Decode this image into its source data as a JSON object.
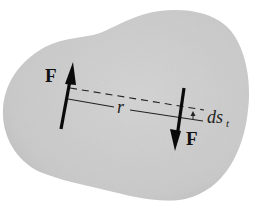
{
  "figure": {
    "colors": {
      "background": "#ffffff",
      "body_fill": "#cdcdcd",
      "body_edge": "#bdbdbd",
      "ink": "#111111"
    },
    "labels": {
      "force_left": "F",
      "force_right": "F",
      "distance": "r",
      "displacement_main": "ds",
      "displacement_sub": "t"
    },
    "elements": {
      "body": "irregular rigid body (gray blob)",
      "force_left_direction": "up",
      "force_right_direction": "down",
      "dashed_line": "displaced line of action between forces",
      "solid_line": "original line between force application points, length r"
    }
  }
}
